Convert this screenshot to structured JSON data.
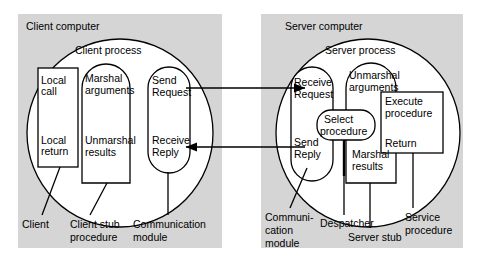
{
  "figure": {
    "type": "diagram",
    "background_color": "#ffffff",
    "panel_color": "#d5d5d5",
    "stroke_color": "#000000"
  },
  "client_panel": {
    "title": "Client computer",
    "process_title": "Client process",
    "nodes": {
      "local_call": "Local\ncall",
      "local_call_l1": "Local",
      "local_call_l2": "call",
      "local_return_l1": "Local",
      "local_return_l2": "return",
      "marshal_l1": "Marshal",
      "marshal_l2": "arguments",
      "unmarshal_l1": "Unmarshal",
      "unmarshal_l2": "results",
      "send_request_l1": "Send",
      "send_request_l2": "Request",
      "receive_reply_l1": "Receive",
      "receive_reply_l2": "Reply"
    },
    "captions": {
      "client": "Client",
      "client_stub_l1": "Client stub",
      "client_stub_l2": "procedure",
      "comm_module_l1": "Communication",
      "comm_module_l2": "module"
    }
  },
  "server_panel": {
    "title": "Server computer",
    "process_title": "Server process",
    "nodes": {
      "receive_request_l1": "Receive",
      "receive_request_l2": "Request",
      "send_reply_l1": "Send",
      "send_reply_l2": "Reply",
      "select_procedure_l1": "Select",
      "select_procedure_l2": "procedure",
      "unmarshal_l1": "Unmarshal",
      "unmarshal_l2": "arguments",
      "marshal_l1": "Marshal",
      "marshal_l2": "results",
      "execute_l1": "Execute",
      "execute_l2": "procedure",
      "return": "Return"
    },
    "captions": {
      "comm_module_l1": "Communi-",
      "comm_module_l2": "cation",
      "comm_module_l3": "module",
      "despatcher": "Despatcher",
      "server_stub": "Server stub",
      "service_procedure_l1": "Service",
      "service_procedure_l2": "procedure"
    }
  },
  "connectors": {
    "request_arrow": "Send Request to Receive Request",
    "reply_arrow": "Send Reply to Receive Reply"
  }
}
